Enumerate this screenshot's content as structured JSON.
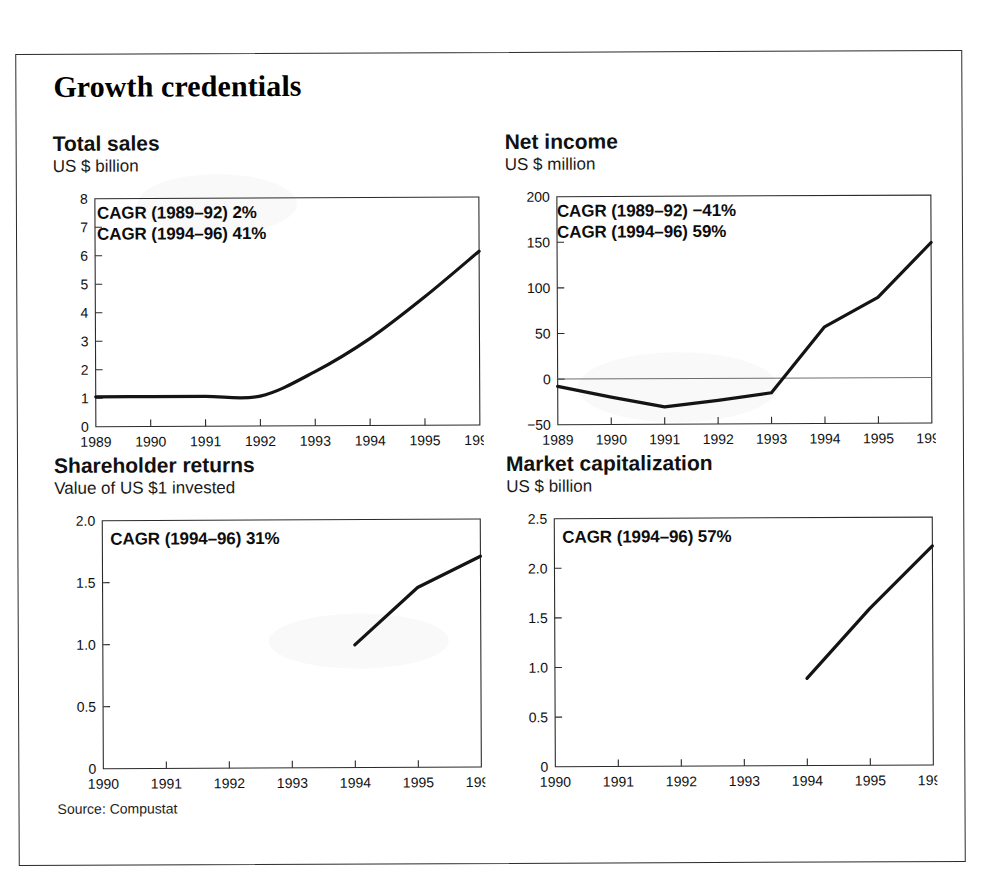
{
  "page": {
    "title": "Growth credentials",
    "source_note": "Source: Compustat"
  },
  "panels": {
    "total_sales": {
      "title": "Total sales",
      "subtitle": "US $ billion"
    },
    "net_income": {
      "title": "Net income",
      "subtitle": "US $ million"
    },
    "shareholder": {
      "title": "Shareholder returns",
      "subtitle": "Value of US $1 invested"
    },
    "market_cap": {
      "title": "Market capitalization",
      "subtitle": "US $ billion"
    }
  },
  "annotations": {
    "total_sales_1": "CAGR (1989–92) 2%",
    "total_sales_2": "CAGR (1994–96) 41%",
    "net_income_1": "CAGR (1989–92) −41%",
    "net_income_2": "CAGR (1994–96) 59%",
    "shareholder_1": "CAGR (1994–96) 31%",
    "market_cap_1": "CAGR (1994–96) 57%"
  },
  "colors": {
    "line": "#141414",
    "axis": "#2b2b2b",
    "zero_line": "#6e6e6e",
    "text": "#111111",
    "background": "#ffffff"
  },
  "chart_data": [
    {
      "id": "total_sales",
      "type": "line",
      "title": "Total sales",
      "subtitle": "US $ billion",
      "xlabel": "",
      "ylabel": "US $ billion",
      "x": [
        1989,
        1990,
        1991,
        1992,
        1993,
        1994,
        1995,
        1996
      ],
      "tick_labels": [
        "1989",
        "1990",
        "1991",
        "1992",
        "1993",
        "1994",
        "1995",
        "1996"
      ],
      "values": [
        1.05,
        1.05,
        1.05,
        1.05,
        1.9,
        3.05,
        4.5,
        6.1
      ],
      "ylim": [
        0,
        8
      ],
      "yticks": [
        0,
        1,
        2,
        3,
        4,
        5,
        6,
        7,
        8
      ],
      "ytick_labels": [
        "0",
        "1",
        "2",
        "3",
        "4",
        "5",
        "6",
        "7",
        "8"
      ],
      "xlim": [
        1989,
        1996
      ],
      "grid": false,
      "zero_line": false,
      "smooth": true,
      "annotations": [
        "CAGR (1989–92) 2%",
        "CAGR (1994–96) 41%"
      ]
    },
    {
      "id": "net_income",
      "type": "line",
      "title": "Net income",
      "subtitle": "US $ million",
      "xlabel": "",
      "ylabel": "US $ million",
      "x": [
        1989,
        1990,
        1991,
        1992,
        1993,
        1994,
        1995,
        1996
      ],
      "tick_labels": [
        "1989",
        "1990",
        "1991",
        "1992",
        "1993",
        "1994",
        "1995",
        "1996"
      ],
      "values": [
        -8,
        -20,
        -31,
        -24,
        -16,
        56,
        88,
        148
      ],
      "ylim": [
        -50,
        200
      ],
      "yticks": [
        -50,
        0,
        50,
        100,
        150,
        200
      ],
      "ytick_labels": [
        "−50",
        "0",
        "50",
        "100",
        "150",
        "200"
      ],
      "xlim": [
        1989,
        1996
      ],
      "grid": false,
      "zero_line": true,
      "smooth": false,
      "annotations": [
        "CAGR (1989–92) −41%",
        "CAGR (1994–96) 59%"
      ]
    },
    {
      "id": "shareholder",
      "type": "line",
      "title": "Shareholder returns",
      "subtitle": "Value of US $1 invested",
      "xlabel": "",
      "ylabel": "Value of US $1 invested",
      "x": [
        1994,
        1995,
        1996
      ],
      "tick_labels": [
        "1990",
        "1991",
        "1992",
        "1993",
        "1994",
        "1995",
        "1996"
      ],
      "tick_values": [
        1990,
        1991,
        1992,
        1993,
        1994,
        1995,
        1996
      ],
      "values": [
        0.99,
        1.45,
        1.7
      ],
      "ylim": [
        0,
        2.0
      ],
      "yticks": [
        0,
        0.5,
        1.0,
        1.5,
        2.0
      ],
      "ytick_labels": [
        "0",
        "0.5",
        "1.0",
        "1.5",
        "2.0"
      ],
      "xlim": [
        1990,
        1996
      ],
      "grid": false,
      "zero_line": false,
      "smooth": false,
      "annotations": [
        "CAGR (1994–96) 31%"
      ]
    },
    {
      "id": "market_cap",
      "type": "line",
      "title": "Market capitalization",
      "subtitle": "US $ billion",
      "xlabel": "",
      "ylabel": "US $ billion",
      "x": [
        1994,
        1995,
        1996
      ],
      "tick_labels": [
        "1990",
        "1991",
        "1992",
        "1993",
        "1994",
        "1995",
        "1996"
      ],
      "tick_values": [
        1990,
        1991,
        1992,
        1993,
        1994,
        1995,
        1996
      ],
      "values": [
        0.88,
        1.58,
        2.21
      ],
      "ylim": [
        0,
        2.5
      ],
      "yticks": [
        0,
        0.5,
        1.0,
        1.5,
        2.0,
        2.5
      ],
      "ytick_labels": [
        "0",
        "0.5",
        "1.0",
        "1.5",
        "2.0",
        "2.5"
      ],
      "xlim": [
        1990,
        1996
      ],
      "grid": false,
      "zero_line": false,
      "smooth": false,
      "annotations": [
        "CAGR (1994–96) 57%"
      ]
    }
  ]
}
